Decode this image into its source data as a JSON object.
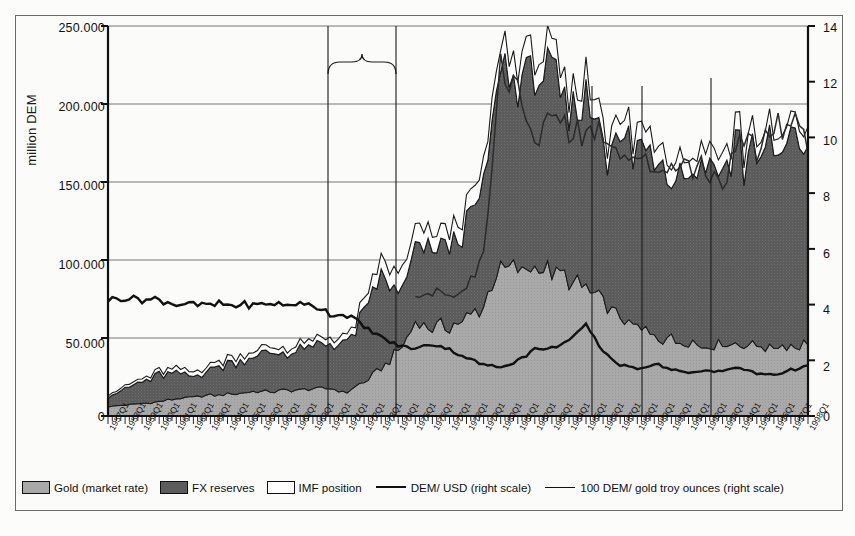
{
  "chart_data": {
    "type": "area",
    "title": "",
    "subtitle": "",
    "ylabel": "million DEM",
    "xlabel": "",
    "ylim": [
      0,
      250000
    ],
    "yticks": [
      "0",
      "50.000",
      "100.000",
      "150.000",
      "200.000",
      "250.000"
    ],
    "y2lim": [
      0,
      14
    ],
    "y2ticks": [
      "0",
      "2",
      "4",
      "6",
      "8",
      "10",
      "12",
      "14"
    ],
    "grid": true,
    "legend_position": "bottom",
    "x_start": "1957Q1",
    "x_end": "1998Q1",
    "x_frequency": "quarterly, labelled annually at Q1",
    "categories": [
      "1957Q1",
      "1958Q1",
      "1959Q1",
      "1960Q1",
      "1961Q1",
      "1962Q1",
      "1963Q1",
      "1964Q1",
      "1965Q1",
      "1966Q1",
      "1967Q1",
      "1968Q1",
      "1969Q1",
      "1970Q1",
      "1971Q1",
      "1972Q1",
      "1973Q1",
      "1974Q1",
      "1975Q1",
      "1976Q1",
      "1977Q1",
      "1978Q1",
      "1979Q1",
      "1980Q1",
      "1981Q1",
      "1982Q1",
      "1983Q1",
      "1984Q1",
      "1985Q1",
      "1986Q1",
      "1987Q1",
      "1988Q1",
      "1989Q1",
      "1990Q1",
      "1991Q1",
      "1992Q1",
      "1993Q1",
      "1994Q1",
      "1995Q1",
      "1996Q1",
      "1997Q1",
      "1998Q1"
    ],
    "series": [
      {
        "name": "Gold (market rate)",
        "type": "stacked-area",
        "scale": "left",
        "color": "#a9a9a9",
        "values": [
          6000,
          7000,
          8000,
          9000,
          11000,
          12000,
          13000,
          14000,
          15000,
          15500,
          16000,
          16500,
          17000,
          17500,
          15000,
          22000,
          30000,
          42000,
          60000,
          56000,
          58000,
          62000,
          72000,
          95000,
          92000,
          96000,
          92000,
          86000,
          82000,
          74000,
          62000,
          56000,
          52000,
          49000,
          48000,
          45000,
          47000,
          47000,
          45000,
          44000,
          45000,
          46000
        ]
      },
      {
        "name": "FX reserves",
        "type": "stacked-area",
        "scale": "left",
        "color": "#5c5c5c",
        "values": [
          7000,
          10000,
          14000,
          17000,
          16000,
          13000,
          17000,
          20000,
          22000,
          24000,
          24000,
          25000,
          26000,
          28000,
          31000,
          43000,
          60000,
          35000,
          45000,
          52000,
          54000,
          60000,
          75000,
          125000,
          120000,
          125000,
          118000,
          108000,
          118000,
          105000,
          112000,
          110000,
          120000,
          114000,
          110000,
          118000,
          112000,
          125000,
          122000,
          118000,
          130000,
          135000
        ]
      },
      {
        "name": "IMF position",
        "type": "stacked-area",
        "scale": "left",
        "color": "#ffffff",
        "values": [
          1500,
          1500,
          2000,
          2500,
          3000,
          3000,
          3000,
          3500,
          3500,
          3500,
          3500,
          3500,
          4000,
          4000,
          4000,
          6000,
          9000,
          12000,
          12000,
          10000,
          10000,
          11000,
          12000,
          14000,
          14000,
          14000,
          13000,
          12000,
          13000,
          12000,
          12000,
          11000,
          11000,
          11000,
          10000,
          11000,
          10000,
          11000,
          11000,
          10000,
          11000,
          11000
        ]
      },
      {
        "name": "DEM/ USD (right scale)",
        "type": "line",
        "scale": "right",
        "color": "#111111",
        "values": [
          4.2,
          4.2,
          4.2,
          4.2,
          4.0,
          4.0,
          4.0,
          4.0,
          4.0,
          4.0,
          4.0,
          4.0,
          4.0,
          3.65,
          3.65,
          3.2,
          2.82,
          2.55,
          2.42,
          2.58,
          2.37,
          2.1,
          1.83,
          1.75,
          2.0,
          2.38,
          2.43,
          2.73,
          3.25,
          2.32,
          1.82,
          1.7,
          1.86,
          1.69,
          1.52,
          1.62,
          1.62,
          1.73,
          1.53,
          1.48,
          1.65,
          1.8
        ]
      },
      {
        "name": "100 DEM/ gold troy ounces (right scale)",
        "type": "line",
        "scale": "right",
        "color": "#333333",
        "values": [
          null,
          null,
          null,
          null,
          null,
          null,
          null,
          null,
          null,
          null,
          null,
          null,
          null,
          null,
          null,
          null,
          null,
          null,
          null,
          4.4,
          4.2,
          4.6,
          5.8,
          12.5,
          11.8,
          9.5,
          11.0,
          10.3,
          10.0,
          10.4,
          9.6,
          9.2,
          8.8,
          9.1,
          8.9,
          9.0,
          8.4,
          9.6,
          9.6,
          10.5,
          10.3,
          10.1
        ]
      }
    ],
    "annotations": [
      {
        "label": "Break-down of Bretton Woods system",
        "x_from": "1971Q1",
        "x_to": "1975Q1",
        "marker": "brace"
      },
      {
        "label": "Plaza",
        "x": "1985Q3",
        "marker": "vline"
      },
      {
        "label": "Louvre",
        "x": "1987Q1",
        "marker": "vline"
      },
      {
        "label": "ERM-crisis",
        "x": "1992Q3",
        "marker": "vline"
      }
    ]
  },
  "axes": {
    "y_title": "million DEM",
    "y_ticks": [
      "250.000",
      "200.000",
      "150.000",
      "100.000",
      "50.000",
      "0"
    ],
    "y2_ticks": [
      "14",
      "12",
      "10",
      "8",
      "6",
      "4",
      "2",
      "0"
    ],
    "x_ticks": [
      "1957Q1",
      "1958Q1",
      "1959Q1",
      "1960Q1",
      "1961Q1",
      "1962Q1",
      "1963Q1",
      "1964Q1",
      "1965Q1",
      "1966Q1",
      "1967Q1",
      "1968Q1",
      "1969Q1",
      "1970Q1",
      "1971Q1",
      "1972Q1",
      "1973Q1",
      "1974Q1",
      "1975Q1",
      "1976Q1",
      "1977Q1",
      "1978Q1",
      "1979Q1",
      "1980Q1",
      "1981Q1",
      "1982Q1",
      "1983Q1",
      "1984Q1",
      "1985Q1",
      "1986Q1",
      "1987Q1",
      "1988Q1",
      "1989Q1",
      "1990Q1",
      "1991Q1",
      "1992Q1",
      "1993Q1",
      "1994Q1",
      "1995Q1",
      "1996Q1",
      "1997Q1",
      "1998Q1"
    ]
  },
  "annotations": {
    "bretton_line1": "Break-down of Bretton",
    "bretton_line2": "Woods system",
    "plaza": "Plaza",
    "louvre": "Louvre",
    "erm": "ERM-crisis"
  },
  "legend": {
    "items": [
      {
        "label": "Gold (market rate)",
        "swatch": "gold",
        "color": "#a9a9a9"
      },
      {
        "label": "FX reserves",
        "swatch": "fx",
        "color": "#5c5c5c"
      },
      {
        "label": "IMF position",
        "swatch": "imf",
        "color": "#ffffff"
      },
      {
        "label": "DEM/ USD (right scale)",
        "swatch": "line-thick",
        "color": "#111111"
      },
      {
        "label": "100 DEM/ gold troy ounces (right scale)",
        "swatch": "line-thin",
        "color": "#333333"
      }
    ]
  },
  "colors": {
    "gold": "#a9a9a9",
    "fx_reserves": "#5c5c5c",
    "imf_position": "#ffffff",
    "dem_usd_line": "#111111",
    "gold_line": "#333333",
    "frame": "#6b6b6b",
    "background": "#fbfbf9"
  }
}
